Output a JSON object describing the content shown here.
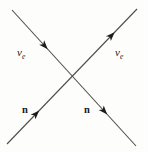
{
  "diagram": {
    "type": "particle-scattering-diagram",
    "background_color": "#fdfdfb",
    "line_color": "#4d4d4d",
    "arrow_color": "#1c1c1c",
    "label_color": "#1a1a1a",
    "canvas": {
      "width": 148,
      "height": 152
    },
    "lines": [
      {
        "name": "trajectory-descending",
        "x1": 12,
        "y1": 10,
        "x2": 136,
        "y2": 146,
        "arrows_t": [
          0.28,
          0.76
        ]
      },
      {
        "name": "trajectory-ascending",
        "x1": 7,
        "y1": 144,
        "x2": 137,
        "y2": 9,
        "arrows_t": [
          0.24,
          0.82
        ]
      }
    ],
    "labels": [
      {
        "id": "neutrino-in",
        "text": "ν",
        "sub": "e",
        "x": 17,
        "y": 56
      },
      {
        "id": "neutrino-out",
        "text": "ν",
        "sub": "e",
        "x": 115,
        "y": 56
      },
      {
        "id": "neutron-in",
        "text": "n",
        "sub": "",
        "x": 22,
        "y": 113
      },
      {
        "id": "neutron-out",
        "text": "n",
        "sub": "",
        "x": 84,
        "y": 113
      }
    ]
  }
}
